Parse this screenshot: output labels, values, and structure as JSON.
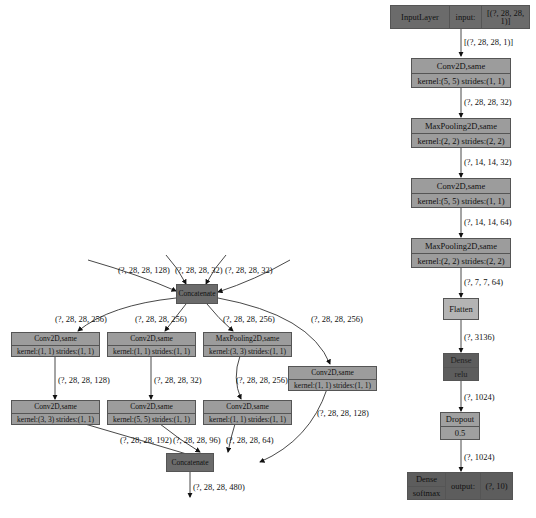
{
  "main_model": {
    "input": {
      "name": "InputLayer",
      "port": "input:",
      "shape": "[(?, 28, 28, 1)]"
    },
    "edges": [
      "[(?, 28, 28, 1)]",
      "(?, 28, 28, 32)",
      "(?, 14, 14, 32)",
      "(?, 14, 14, 64)",
      "(?, 7, 7, 64)",
      "(?, 3136)",
      "(?, 1024)",
      "(?, 1024)"
    ],
    "layers": [
      {
        "title": "Conv2D,same",
        "detail": "kernel:(5, 5) strides:(1, 1)"
      },
      {
        "title": "MaxPooling2D,same",
        "detail": "kernel:(2, 2) strides:(2, 2)"
      },
      {
        "title": "Conv2D,same",
        "detail": "kernel:(5, 5) strides:(1, 1)"
      },
      {
        "title": "MaxPooling2D,same",
        "detail": "kernel:(2, 2) strides:(2, 2)"
      },
      {
        "title": "Flatten"
      },
      {
        "title": "Dense",
        "detail": "relu"
      },
      {
        "title": "Dropout",
        "detail": "0.5"
      }
    ],
    "output": {
      "name": "Dense",
      "activation": "softmax",
      "port": "output:",
      "shape": "(?, 10)"
    }
  },
  "inception_block": {
    "input_edges": [
      "(?, 28, 28, 128)",
      "(?, 28, 28, 32)",
      "(?, 28, 28, 32)"
    ],
    "concat_top": "Concatenate",
    "branch_edges": [
      "(?, 28, 28, 256)",
      "(?, 28, 28, 256)",
      "(?, 28, 28, 256)",
      "(?, 28, 28, 256)"
    ],
    "branch1": [
      {
        "title": "Conv2D,same",
        "detail": "kernel:(1, 1) strides:(1, 1)"
      },
      {
        "title": "Conv2D,same",
        "detail": "kernel:(3, 3) strides:(1, 1)"
      }
    ],
    "branch1_mid": "(?, 28, 28, 128)",
    "branch2": [
      {
        "title": "Conv2D,same",
        "detail": "kernel:(1, 1) strides:(1, 1)"
      },
      {
        "title": "Conv2D,same",
        "detail": "kernel:(5, 5) strides:(1, 1)"
      }
    ],
    "branch2_mid": "(?, 28, 28, 32)",
    "branch3": [
      {
        "title": "MaxPooling2D,same",
        "detail": "kernel:(3, 3) strides:(1, 1)"
      },
      {
        "title": "Conv2D,same",
        "detail": "kernel:(1, 1) strides:(1, 1)"
      }
    ],
    "branch3_mid": "(?, 28, 28, 256)",
    "branch4": {
      "title": "Conv2D,same",
      "detail": "kernel:(1, 1) strides:(1, 1)"
    },
    "out_edges": [
      "(?, 28, 28, 192)",
      "(?, 28, 28, 96)",
      "(?, 28, 28, 64)",
      "(?, 28, 28, 128)"
    ],
    "concat_bottom": "Concatenate",
    "final_edge": "(?, 28, 28, 480)"
  }
}
